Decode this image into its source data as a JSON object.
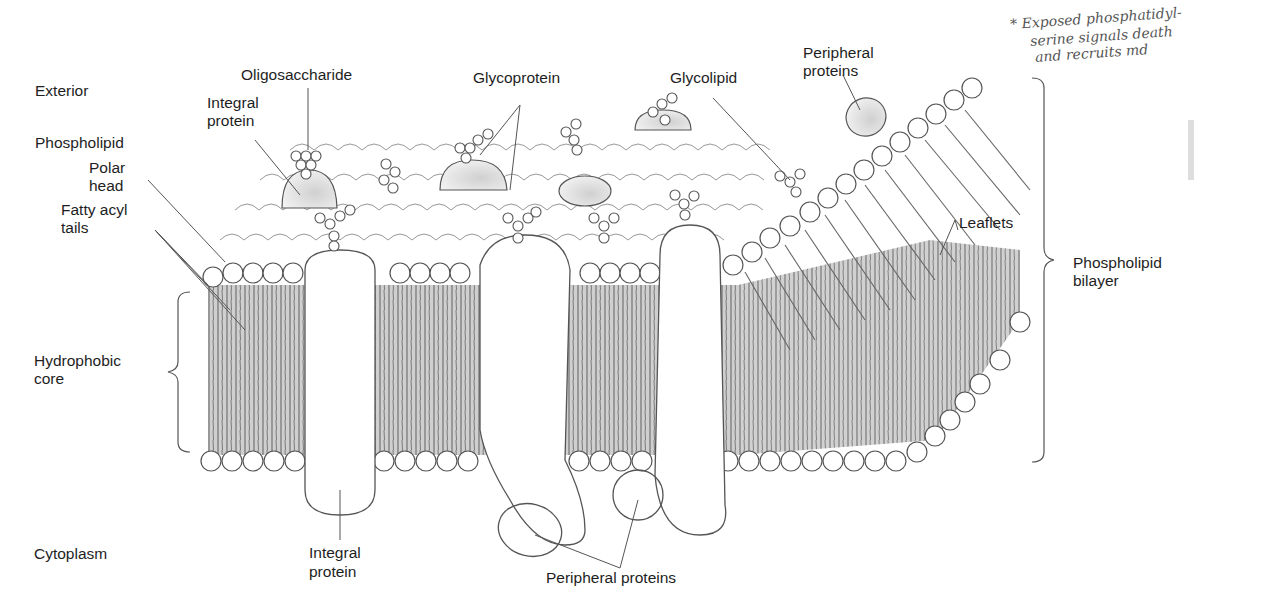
{
  "diagram": {
    "regions": {
      "exterior": "Exterior",
      "cytoplasm": "Cytoplasm"
    },
    "labels": {
      "oligosaccharide": "Oligosaccharide",
      "integral_protein_top_1": "Integral",
      "integral_protein_top_2": "protein",
      "glycoprotein": "Glycoprotein",
      "glycolipid": "Glycolipid",
      "peripheral_proteins_top_1": "Peripheral",
      "peripheral_proteins_top_2": "proteins",
      "phospholipid": "Phospholipid",
      "polar_head_1": "Polar",
      "polar_head_2": "head",
      "fatty_acyl_tails_1": "Fatty acyl",
      "fatty_acyl_tails_2": "tails",
      "hydrophobic_core_1": "Hydrophobic",
      "hydrophobic_core_2": "core",
      "leaflets": "Leaflets",
      "phospholipid_bilayer_1": "Phospholipid",
      "phospholipid_bilayer_2": "bilayer",
      "integral_protein_bottom_1": "Integral",
      "integral_protein_bottom_2": "protein",
      "peripheral_proteins_bottom": "Peripheral proteins"
    },
    "handwritten_note": {
      "line1": "* Exposed phosphatidyl-",
      "line2": "serine signals death",
      "line3": "and recruits md"
    },
    "colors": {
      "line": "#555555",
      "core_fill": "#c8c8c8",
      "protein_fill": "#ffffff",
      "text": "#1e1e1e"
    }
  }
}
